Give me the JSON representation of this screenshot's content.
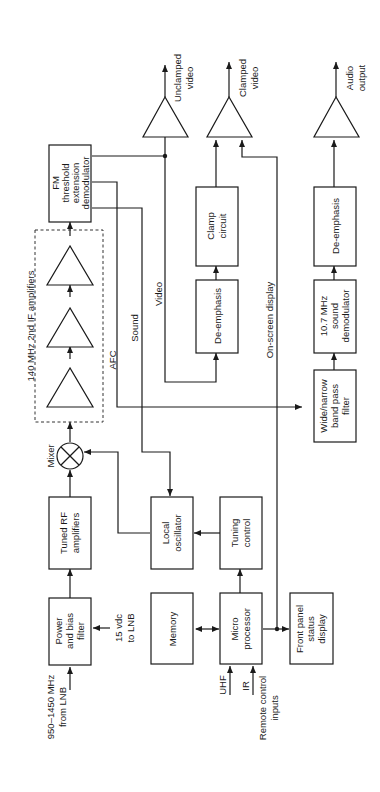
{
  "blocks": {
    "power_filter": [
      "Power",
      "and bias",
      "filter"
    ],
    "tuned_rf": [
      "Tuned RF",
      "amplifiers"
    ],
    "local_osc": [
      "Local",
      "oscillator"
    ],
    "tuning_control": [
      "Tuning",
      "control"
    ],
    "memory": [
      "Memory"
    ],
    "microprocessor": [
      "Micro",
      "processor"
    ],
    "front_panel": [
      "Front panel",
      "status",
      "display"
    ],
    "fm_demod": [
      "FM",
      "threshold",
      "extension",
      "demodulator"
    ],
    "de_emphasis_video": [
      "De-emphasis"
    ],
    "clamp": [
      "Clamp",
      "circuit"
    ],
    "bandpass": [
      "Wide/narrow",
      "band pass",
      "filter"
    ],
    "sound_demod": [
      "10.7 MHz",
      "sound",
      "demodulator"
    ],
    "de_emphasis_audio": [
      "De-emphasis"
    ]
  },
  "labels": {
    "input": [
      "950–1450 MHz",
      "from LNB"
    ],
    "vdc": [
      "15 vdc",
      "to LNB"
    ],
    "mixer": "Mixer",
    "if_group": "140 MHz 2nd IF amplifiers",
    "afc": "AFC",
    "sound": "Sound",
    "video": "Video",
    "osd": "On-screen display",
    "uhf": "UHF",
    "ir": "IR",
    "remote": [
      "Remote control",
      "inputs"
    ],
    "unclamped": [
      "Unclamped",
      "video"
    ],
    "clamped": [
      "Clamped",
      "video"
    ],
    "audio": [
      "Audio",
      "output"
    ]
  }
}
